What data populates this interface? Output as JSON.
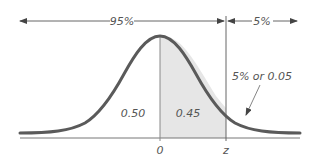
{
  "diagram": {
    "type": "normal-distribution-one-tailed",
    "colors": {
      "curve": "#5a5a5a",
      "shade": "#e6e6e6",
      "lines": "#666666",
      "text": "#555555",
      "background": "#ffffff"
    },
    "top_annotations": {
      "left_span_label": "95%",
      "right_span_label": "5%"
    },
    "region_labels": {
      "left_half": "0.50",
      "shaded": "0.45",
      "tail_callout": "5% or 0.05"
    },
    "axis_labels": {
      "mean": "0",
      "critical": "z"
    }
  }
}
